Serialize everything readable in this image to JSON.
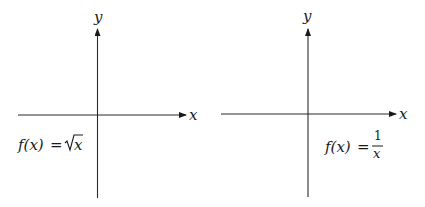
{
  "panels": [
    {
      "id": "sqrt",
      "axis_labels": {
        "x": "x",
        "y": "y"
      },
      "formula": {
        "lhs": "f(x)",
        "eq": "=",
        "rhs_radicand": "x",
        "text": "f(x) = √x"
      }
    },
    {
      "id": "reciprocal",
      "axis_labels": {
        "x": "x",
        "y": "y"
      },
      "formula": {
        "lhs": "f(x)",
        "eq": "=",
        "numerator": "1",
        "denominator": "x",
        "text": "f(x) = 1/x"
      }
    }
  ]
}
